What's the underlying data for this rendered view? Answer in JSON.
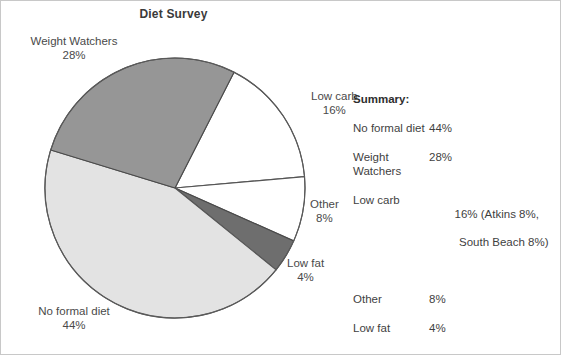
{
  "chart_data": {
    "type": "pie",
    "title": "Diet Survey",
    "categories": [
      "Low carb",
      "Other",
      "Low fat",
      "No formal diet",
      "Weight Watchers"
    ],
    "values": [
      16,
      8,
      4,
      44,
      28
    ],
    "unit": "%",
    "legend": "none",
    "labels_position": "outside-callout",
    "slices": [
      {
        "name": "Low carb",
        "value": 16,
        "label": "Low carb",
        "percent_text": "16%",
        "color": "#ffffff",
        "stroke": "#555555",
        "start_angle_deg": 27,
        "end_angle_deg": 85
      },
      {
        "name": "Other",
        "value": 8,
        "label": "Other",
        "percent_text": "8%",
        "color": "#ffffff",
        "stroke": "#555555",
        "start_angle_deg": 85,
        "end_angle_deg": 114
      },
      {
        "name": "Low fat",
        "value": 4,
        "label": "Low fat",
        "percent_text": "4%",
        "color": "#6e6e6e",
        "stroke": "#4a4a4a",
        "start_angle_deg": 114,
        "end_angle_deg": 129
      },
      {
        "name": "No formal diet",
        "value": 44,
        "label": "No formal diet",
        "percent_text": "44%",
        "color": "#e3e3e3",
        "stroke": "#555555",
        "start_angle_deg": 129,
        "end_angle_deg": 287
      },
      {
        "name": "Weight Watchers",
        "value": 28,
        "label": "Weight Watchers",
        "percent_text": "28%",
        "color": "#969696",
        "stroke": "#4a4a4a",
        "start_angle_deg": 287,
        "end_angle_deg": 387
      }
    ]
  },
  "title": "Diet Survey",
  "pie_labels": {
    "weight_watchers": {
      "name": "Weight Watchers",
      "percent": "28%"
    },
    "low_carb": {
      "name": "Low carb",
      "percent": "16%"
    },
    "other": {
      "name": "Other",
      "percent": "8%"
    },
    "low_fat": {
      "name": "Low fat",
      "percent": "4%"
    },
    "no_formal_diet": {
      "name": "No formal diet",
      "percent": "44%"
    }
  },
  "summary": {
    "heading": "Summary:",
    "rows": [
      {
        "name": "No formal diet",
        "value": "44%",
        "note": "",
        "note2": ""
      },
      {
        "name": "Weight",
        "name2": "Watchers",
        "value": "28%",
        "note": "",
        "note2": ""
      },
      {
        "name": "Low carb",
        "value": "16% (Atkins 8%,",
        "note2": "South Beach 8%)"
      },
      {
        "name": "Other",
        "value": "8%",
        "note": "",
        "note2": ""
      },
      {
        "name": "Low fat",
        "value": "4%",
        "note": "",
        "note2": ""
      }
    ]
  }
}
